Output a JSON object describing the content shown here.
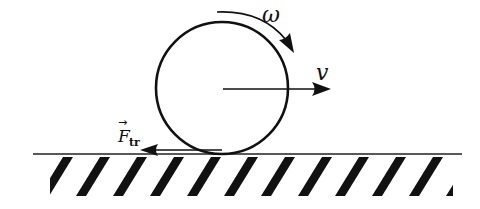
{
  "diagram": {
    "labels": {
      "omega": "ω",
      "velocity": "v",
      "friction_main": "F",
      "friction_sub": "tr",
      "friction_vector_mark": "→"
    },
    "wheel": {
      "cx": 222,
      "cy": 88,
      "r": 66
    },
    "ground": {
      "y": 154,
      "x1": 33,
      "x2": 462
    },
    "hatch": {
      "top": 157,
      "bottom": 196,
      "spacing": 37,
      "count": 12
    },
    "colors": {
      "ink": "#111111",
      "background": "#ffffff"
    }
  }
}
